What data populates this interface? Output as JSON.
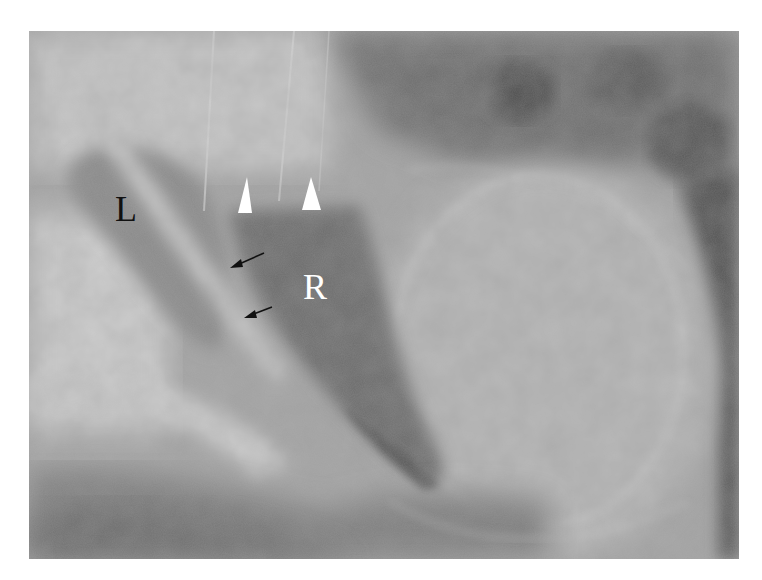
{
  "figure": {
    "type": "lateral chest radiograph",
    "background_color": "#ffffff",
    "labels": [
      {
        "id": "L",
        "text": "L",
        "color": "#111111"
      },
      {
        "id": "R",
        "text": "R",
        "color": "#ffffff"
      }
    ],
    "annotations": {
      "white_arrowheads": 2,
      "black_arrows": 2,
      "arrowhead_color": "#ffffff",
      "arrow_color": "#111111"
    }
  }
}
